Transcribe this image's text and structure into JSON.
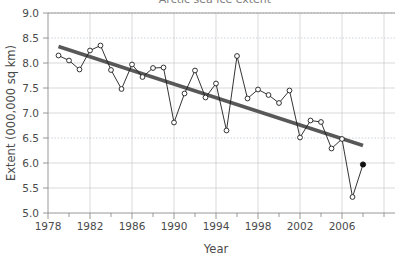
{
  "chart_data": {
    "type": "line",
    "title": "Arctic sea ice extent",
    "xlabel": "Year",
    "ylabel": "Extent (000,000 sq km)",
    "xlim": [
      1978,
      2008
    ],
    "ylim": [
      5.0,
      9.0
    ],
    "grid": true,
    "legend": "none",
    "x_ticks": [
      1978,
      1982,
      1986,
      1990,
      1994,
      1998,
      2002,
      2006
    ],
    "x_tick_labels": [
      "1978",
      "1982",
      "1986",
      "1990",
      "1994",
      "1998",
      "2002",
      "2006"
    ],
    "x_minor_ticks": [
      1980,
      1984,
      1988,
      1992,
      1996,
      2000,
      2004,
      2008
    ],
    "y_ticks": [
      5.0,
      5.5,
      6.0,
      6.5,
      7.0,
      7.5,
      8.0,
      8.5,
      9.0
    ],
    "y_tick_labels": [
      "5.0",
      "5.5",
      "6.0",
      "6.5",
      "7.0",
      "7.5",
      "8.0",
      "8.5",
      "9.0"
    ],
    "series": [
      {
        "name": "Sea ice extent",
        "marker": "open-circle",
        "color": "#1d1d1d",
        "x": [
          1979,
          1980,
          1981,
          1982,
          1983,
          1984,
          1985,
          1986,
          1987,
          1988,
          1989,
          1990,
          1991,
          1992,
          1993,
          1994,
          1995,
          1996,
          1997,
          1998,
          1999,
          2000,
          2001,
          2002,
          2003,
          2004,
          2005,
          2006,
          2007
        ],
        "values": [
          8.15,
          8.05,
          7.87,
          8.25,
          8.35,
          7.86,
          7.48,
          7.97,
          7.72,
          7.9,
          7.91,
          6.81,
          7.39,
          7.85,
          7.31,
          7.59,
          6.65,
          8.14,
          7.29,
          7.47,
          7.36,
          7.2,
          7.45,
          6.51,
          6.85,
          6.82,
          6.29,
          6.48,
          5.32
        ],
        "last_point": {
          "x": 2008,
          "value": 5.97,
          "marker": "filled-circle",
          "color": "#111111"
        }
      },
      {
        "name": "Linear trend",
        "type": "trend",
        "color": "#585858",
        "x": [
          1979,
          2008
        ],
        "values": [
          8.33,
          6.35
        ]
      }
    ]
  }
}
